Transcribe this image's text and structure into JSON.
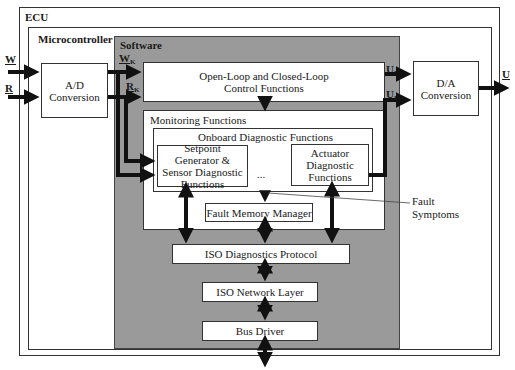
{
  "diagram": {
    "ecu": {
      "label": "ECU"
    },
    "microcontroller": {
      "label": "Microcontroller"
    },
    "software": {
      "label": "Software",
      "fill": "#9a9a9a"
    },
    "ad_conversion": {
      "label": "A/D Conversion"
    },
    "da_conversion": {
      "label": "D/A Conversion"
    },
    "control_functions": {
      "label": "Open-Loop and Closed-Loop Control Functions"
    },
    "monitoring": {
      "label": "Monitoring Functions"
    },
    "onboard_diag": {
      "label": "Onboard Diagnostic Functions"
    },
    "setpoint_diag": {
      "label": "Setpoint Generator & Sensor Diagnostic Functions"
    },
    "ellipsis": "...",
    "actuator_diag": {
      "label": "Actuator Diagnostic Functions"
    },
    "fault_memory": {
      "label": "Fault Memory Manager"
    },
    "fault_symptoms": {
      "label": "Fault Symptoms"
    },
    "iso_diag_protocol": {
      "label": "ISO Diagnostics Protocol"
    },
    "iso_network": {
      "label": "ISO Network Layer"
    },
    "bus_driver": {
      "label": "Bus Driver"
    },
    "signals": {
      "W": "W",
      "R": "R",
      "U": "U",
      "Wk": "W",
      "Rk": "R",
      "Uk1": "U",
      "Uk2": "U",
      "sub_k": "K"
    }
  }
}
